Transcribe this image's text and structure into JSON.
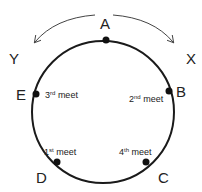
{
  "diagram": {
    "type": "circular track",
    "points": [
      {
        "id": "A",
        "label": "A"
      },
      {
        "id": "B",
        "label": "B"
      },
      {
        "id": "C",
        "label": "C"
      },
      {
        "id": "D",
        "label": "D"
      },
      {
        "id": "E",
        "label": "E"
      }
    ],
    "directions": {
      "left": "Y",
      "right": "X"
    },
    "meets": [
      {
        "num": "1",
        "suffix": "st",
        "word": "meet"
      },
      {
        "num": "2",
        "suffix": "nd",
        "word": "meet"
      },
      {
        "num": "3",
        "suffix": "rd",
        "word": "meet"
      },
      {
        "num": "4",
        "suffix": "th",
        "word": "meet"
      }
    ],
    "colors": {
      "stroke": "#1a1a1a"
    }
  }
}
